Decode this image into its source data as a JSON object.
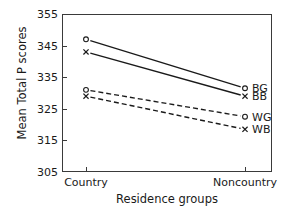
{
  "chart_data": {
    "type": "line",
    "title": "",
    "xlabel": "Residence groups",
    "ylabel": "Mean Total P scores",
    "categories": [
      "Country",
      "Noncountry"
    ],
    "ylim": [
      305,
      355
    ],
    "yticks": [
      355,
      345,
      335,
      325,
      315,
      305
    ],
    "grid": false,
    "legend_position": "right",
    "series": [
      {
        "name": "BG",
        "values": [
          347.0,
          331.5
        ],
        "linestyle": "solid",
        "marker": "circle",
        "color": "#1a1a1a"
      },
      {
        "name": "BB",
        "values": [
          343.0,
          329.0
        ],
        "linestyle": "solid",
        "marker": "x",
        "color": "#1a1a1a"
      },
      {
        "name": "WG",
        "values": [
          331.0,
          322.5
        ],
        "linestyle": "dashed",
        "marker": "circle",
        "color": "#1a1a1a"
      },
      {
        "name": "WB",
        "values": [
          329.0,
          318.5
        ],
        "linestyle": "dashed",
        "marker": "x",
        "color": "#1a1a1a"
      }
    ]
  },
  "axis": {
    "ytick_labels": [
      "355",
      "345",
      "335",
      "325",
      "315",
      "305"
    ],
    "xtick_labels": [
      "Country",
      "Noncountry"
    ],
    "y_title": "Mean Total P scores",
    "x_title": "Residence groups"
  },
  "legend": {
    "entries": [
      {
        "label": "BG"
      },
      {
        "label": "BB"
      },
      {
        "label": "WG"
      },
      {
        "label": "WB"
      }
    ]
  },
  "style": {
    "axis_color": "#3a3a3a",
    "line_color": "#1a1a1a",
    "background": "#ffffff"
  }
}
